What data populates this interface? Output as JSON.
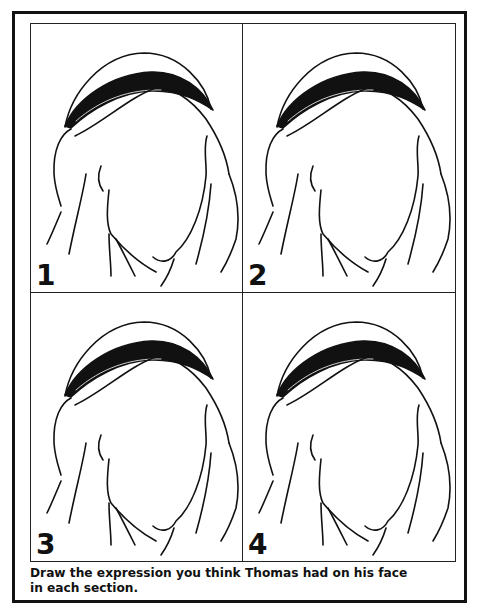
{
  "worksheet": {
    "panels": [
      {
        "number": "1",
        "drawing": "head-with-headcloth-blank-face"
      },
      {
        "number": "2",
        "drawing": "head-with-headcloth-blank-face"
      },
      {
        "number": "3",
        "drawing": "head-with-headcloth-blank-face"
      },
      {
        "number": "4",
        "drawing": "head-with-headcloth-blank-face"
      }
    ],
    "instructions": {
      "line1": "Draw the expression you think Thomas had on his face",
      "line2": "in each section."
    }
  },
  "colors": {
    "ink": "#111111",
    "paper": "#ffffff"
  }
}
